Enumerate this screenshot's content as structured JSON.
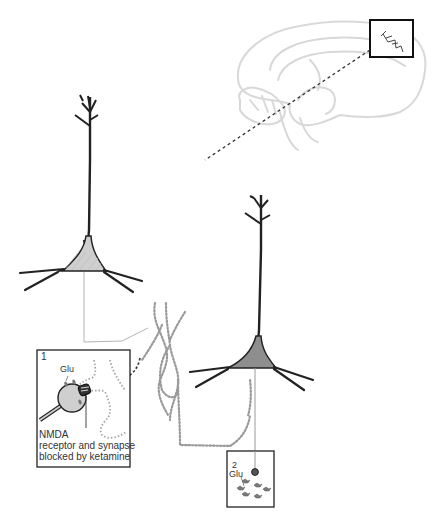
{
  "figure": {
    "colors": {
      "outline": "#222222",
      "brain_outline": "#d6d6d6",
      "soma_left_fill": "#cfcfcf",
      "soma_right_fill": "#8e8e8e",
      "dotted_axon": "#9a9a9a",
      "connector_line": "#b0b0b0",
      "leader_dashed": "#333333",
      "text": "#333333"
    }
  },
  "brain_inset": {
    "label": "prefrontal-region-highlight"
  },
  "inset_1": {
    "number": "1",
    "glu_label": "Glu",
    "caption_line1": "NMDA",
    "caption_line2": "receptor and synapse",
    "caption_line3": "blocked by ketamine"
  },
  "inset_2": {
    "number": "2",
    "glu_label": "Glu"
  }
}
